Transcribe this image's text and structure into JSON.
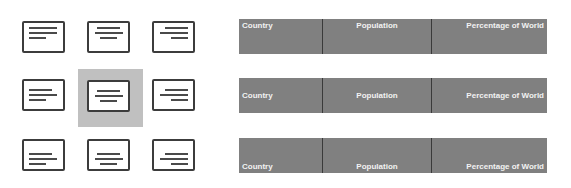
{
  "alignment_grid": {
    "selected": "middle-center",
    "selection_color": "#c0c0c0",
    "buttons": [
      {
        "id": "top-left",
        "label": "Align Top Left"
      },
      {
        "id": "top-center",
        "label": "Align Top Center"
      },
      {
        "id": "top-right",
        "label": "Align Top Right"
      },
      {
        "id": "middle-left",
        "label": "Align Middle Left"
      },
      {
        "id": "middle-center",
        "label": "Align Middle Center"
      },
      {
        "id": "middle-right",
        "label": "Align Middle Right"
      },
      {
        "id": "bottom-left",
        "label": "Align Bottom Left"
      },
      {
        "id": "bottom-center",
        "label": "Align Bottom Center"
      },
      {
        "id": "bottom-right",
        "label": "Align Bottom Right"
      }
    ]
  },
  "tables": [
    {
      "vertical_alignment": "top",
      "headers": [
        "Country",
        "Population",
        "Percentage of World"
      ]
    },
    {
      "vertical_alignment": "middle",
      "headers": [
        "Country",
        "Population",
        "Percentage of World"
      ]
    },
    {
      "vertical_alignment": "bottom",
      "headers": [
        "Country",
        "Population",
        "Percentage of World"
      ]
    }
  ],
  "colors": {
    "header_fill": "#808080",
    "header_text": "#f2f2f2",
    "cell_divider": "#3a3a3a",
    "icon_stroke": "#3c3c3c"
  }
}
